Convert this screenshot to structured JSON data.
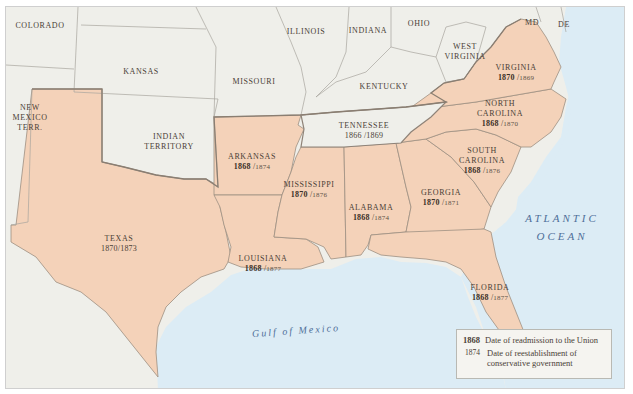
{
  "map": {
    "colors": {
      "confederate_fill": "#f4d2b9",
      "union_fill": "#efefea",
      "water": "#dcecf5",
      "state_border": "#9c9890",
      "confederate_border": "#8f8378",
      "ocean_label": "#4f6f99"
    },
    "states_confederate": [
      {
        "name": "TEXAS",
        "readmission": "1870",
        "conservative": "1873"
      },
      {
        "name": "ARKANSAS",
        "readmission": "1868",
        "conservative": "1874"
      },
      {
        "name": "LOUISIANA",
        "readmission": "1868",
        "conservative": "1877"
      },
      {
        "name": "MISSISSIPPI",
        "readmission": "1870",
        "conservative": "1876"
      },
      {
        "name": "ALABAMA",
        "readmission": "1868",
        "conservative": "1874"
      },
      {
        "name": "GEORGIA",
        "readmission": "1870",
        "conservative": "1871"
      },
      {
        "name": "FLORIDA",
        "readmission": "1868",
        "conservative": "1877"
      },
      {
        "name": "SOUTH CAROLINA",
        "line1": "SOUTH",
        "line2": "CAROLINA",
        "readmission": "1868",
        "conservative": "1876"
      },
      {
        "name": "NORTH CAROLINA",
        "line1": "NORTH",
        "line2": "CAROLINA",
        "readmission": "1868",
        "conservative": "1870"
      },
      {
        "name": "VIRGINIA",
        "readmission": "1870",
        "conservative": "1869"
      },
      {
        "name": "TENNESSEE",
        "readmission": "1866",
        "conservative": "1869"
      }
    ],
    "states_other": [
      {
        "name": "COLORADO"
      },
      {
        "name": "KANSAS"
      },
      {
        "name": "MISSOURI"
      },
      {
        "name": "ILLINOIS"
      },
      {
        "name": "INDIANA"
      },
      {
        "name": "OHIO"
      },
      {
        "name": "WEST VIRGINIA",
        "line1": "WEST",
        "line2": "VIRGINIA"
      },
      {
        "name": "KENTUCKY"
      },
      {
        "name": "MD"
      },
      {
        "name": "DE"
      },
      {
        "name": "NEW MEXICO TERR.",
        "line1": "NEW",
        "line2": "MEXICO",
        "line3": "TERR."
      },
      {
        "name": "INDIAN TERRITORY",
        "line1": "INDIAN",
        "line2": "TERRITORY"
      }
    ],
    "water_labels": {
      "atlantic_line1": "ATLANTIC",
      "atlantic_line2": "OCEAN",
      "gulf": "Gulf  of  Mexico"
    },
    "legend": {
      "bold_year": "1868",
      "bold_desc": "Date of readmission to the Union",
      "light_year": "1874",
      "light_desc_line1": "Date of reestablishment of",
      "light_desc_line2": "conservative government"
    }
  }
}
